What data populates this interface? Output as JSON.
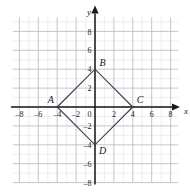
{
  "figure": {
    "kind": "coordinate-plane-diagram",
    "axes": {
      "x_axis_label": "x",
      "y_axis_label": "y",
      "origin_label": "0",
      "x_ticks": [
        "-8",
        "-6",
        "-4",
        "-2",
        "2",
        "4",
        "6",
        "8"
      ],
      "y_ticks": [
        "8",
        "6",
        "4",
        "2",
        "-2",
        "-4",
        "-6",
        "-8"
      ],
      "x_range": [
        -9,
        9
      ],
      "y_range": [
        -9,
        9
      ],
      "grid": "on",
      "minor_grid_step": 1,
      "major_grid_step": 2
    },
    "shape": {
      "name": "rhombus-abcd",
      "vertices": [
        {
          "label": "A",
          "x": -4,
          "y": 0
        },
        {
          "label": "B",
          "x": 0,
          "y": 4
        },
        {
          "label": "C",
          "x": 4,
          "y": 0
        },
        {
          "label": "D",
          "x": 0,
          "y": -4
        }
      ]
    },
    "colors": {
      "axis": "#1a1a1a",
      "shape_stroke": "#3a3a46",
      "major_grid": "#b9b9c6",
      "minor_grid": "#dcdce4",
      "background": "#ffffff"
    }
  }
}
